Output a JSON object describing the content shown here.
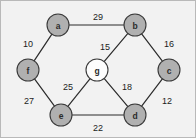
{
  "figure": {
    "background_color": "#f2f2f2",
    "border_color": "#b9b9b9",
    "width": 196,
    "height": 138
  },
  "chart_data": {
    "type": "diagram",
    "diagram_kind": "undirected-weighted-graph",
    "title": "",
    "xlabel": "",
    "ylabel": "",
    "node_fill_peripheral": "#b0b0b0",
    "node_fill_center": "#fdfdfd",
    "node_stroke": "#3a3a3a",
    "edge_color": "#2b2b2b",
    "nodes": [
      {
        "id": "a",
        "label": "a",
        "x": 57,
        "y": 24,
        "r": 11,
        "style": "filled"
      },
      {
        "id": "b",
        "label": "b",
        "x": 134,
        "y": 24,
        "r": 11,
        "style": "filled"
      },
      {
        "id": "c",
        "label": "c",
        "x": 168,
        "y": 69,
        "r": 11,
        "style": "filled"
      },
      {
        "id": "d",
        "label": "d",
        "x": 134,
        "y": 114,
        "r": 11,
        "style": "filled"
      },
      {
        "id": "e",
        "label": "e",
        "x": 60,
        "y": 114,
        "r": 11,
        "style": "filled"
      },
      {
        "id": "f",
        "label": "f",
        "x": 27,
        "y": 69,
        "r": 11,
        "style": "filled"
      },
      {
        "id": "g",
        "label": "g",
        "x": 96,
        "y": 69,
        "r": 11,
        "style": "hub"
      }
    ],
    "edges": [
      {
        "source": "a",
        "target": "b",
        "weight": 29,
        "label_x": 97,
        "label_y": 16
      },
      {
        "source": "b",
        "target": "c",
        "weight": 16,
        "label_x": 168,
        "label_y": 43
      },
      {
        "source": "c",
        "target": "d",
        "weight": 12,
        "label_x": 166,
        "label_y": 100
      },
      {
        "source": "d",
        "target": "e",
        "weight": 22,
        "label_x": 97,
        "label_y": 127
      },
      {
        "source": "e",
        "target": "f",
        "weight": 27,
        "label_x": 28,
        "label_y": 100
      },
      {
        "source": "f",
        "target": "a",
        "weight": 10,
        "label_x": 27,
        "label_y": 43
      },
      {
        "source": "g",
        "target": "b",
        "weight": 15,
        "label_x": 104,
        "label_y": 46
      },
      {
        "source": "g",
        "target": "d",
        "weight": 18,
        "label_x": 126,
        "label_y": 86
      },
      {
        "source": "g",
        "target": "e",
        "weight": 25,
        "label_x": 67,
        "label_y": 86
      }
    ],
    "node_labels": [
      "a",
      "b",
      "c",
      "d",
      "e",
      "f",
      "g"
    ],
    "weights": [
      29,
      16,
      12,
      22,
      27,
      10,
      15,
      18,
      25
    ]
  }
}
